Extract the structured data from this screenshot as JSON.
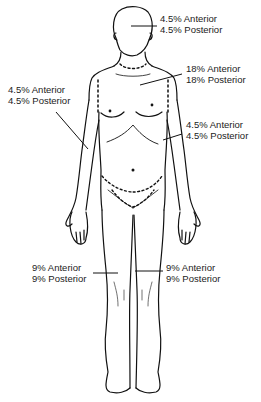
{
  "diagram": {
    "regions": [
      {
        "id": "head",
        "anterior": "4.5% Anterior",
        "posterior": "4.5% Posterior"
      },
      {
        "id": "trunk",
        "anterior": "18% Anterior",
        "posterior": "18% Posterior"
      },
      {
        "id": "right-arm",
        "anterior": "4.5% Anterior",
        "posterior": "4.5% Posterior"
      },
      {
        "id": "left-arm",
        "anterior": "4.5% Anterior",
        "posterior": "4.5% Posterior"
      },
      {
        "id": "right-leg",
        "anterior": "9% Anterior",
        "posterior": "9% Posterior"
      },
      {
        "id": "left-leg",
        "anterior": "9% Anterior",
        "posterior": "9% Posterior"
      }
    ]
  }
}
